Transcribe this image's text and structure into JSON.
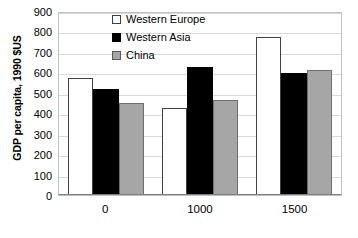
{
  "chart_data": {
    "type": "bar",
    "title": "",
    "xlabel": "",
    "ylabel": "GDP per capita, 1990 $US",
    "categories": [
      "0",
      "1000",
      "1500"
    ],
    "series": [
      {
        "name": "Western Europe",
        "values": [
          570,
          425,
          772
        ],
        "color": "#ffffff"
      },
      {
        "name": "Western Asia",
        "values": [
          520,
          625,
          595
        ],
        "color": "#000000"
      },
      {
        "name": "China",
        "values": [
          450,
          465,
          610
        ],
        "color": "#a6a6a6"
      }
    ],
    "ylim": [
      0,
      900
    ],
    "ytick_step": 100,
    "yticks": [
      "900",
      "800",
      "700",
      "600",
      "500",
      "400",
      "300",
      "200",
      "100",
      "0"
    ],
    "grid": true,
    "legend_position": "inside-upper-left"
  },
  "legend": {
    "items": [
      {
        "label": "Western Europe",
        "swatch": "white-square-outline-icon"
      },
      {
        "label": "Western Asia",
        "swatch": "black-square-icon"
      },
      {
        "label": "China",
        "swatch": "gray-square-icon"
      }
    ]
  }
}
